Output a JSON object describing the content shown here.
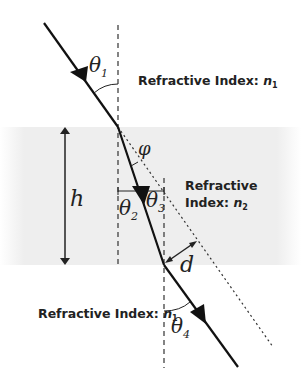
{
  "diagram": {
    "labels": {
      "top_medium": "Refractive Index: ",
      "top_medium_symbol": "n",
      "top_medium_sub": "1",
      "slab_medium_line1": "Refractive",
      "slab_medium_line2": "Index: ",
      "slab_medium_symbol": "n",
      "slab_medium_sub": "2",
      "bottom_medium": "Refractive Index: ",
      "bottom_medium_symbol": "n",
      "bottom_medium_sub": "1"
    },
    "symbols": {
      "theta": "θ",
      "theta1_sub": "1",
      "theta2_sub": "2",
      "theta3_sub": "3",
      "theta4_sub": "4",
      "phi": "φ",
      "height": "h",
      "displacement": "d"
    },
    "colors": {
      "ray": "#111111",
      "slab": "#efefef",
      "text": "#222222"
    }
  }
}
